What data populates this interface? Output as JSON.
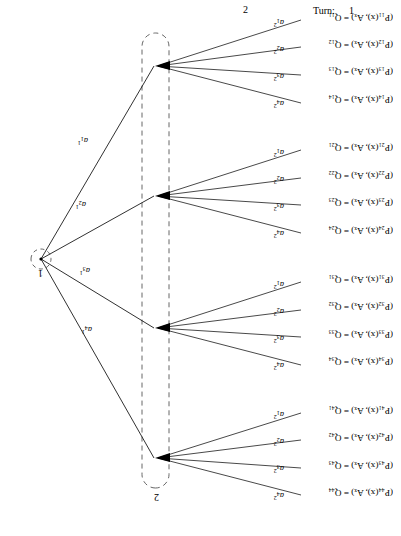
{
  "header": {
    "turn_label": "Turn:",
    "turn_value": "1",
    "player_marker": "2"
  },
  "tree": {
    "root": {
      "id": "root",
      "player_label": "1",
      "x": 360,
      "y": 277
    },
    "infoset": {
      "player_label": "2",
      "label_x": 245,
      "label_y": 41
    },
    "decision_nodes": [
      {
        "id": "n1",
        "x": 245,
        "y": 470,
        "group": 1
      },
      {
        "id": "n2",
        "x": 245,
        "y": 340,
        "group": 2
      },
      {
        "id": "n3",
        "x": 245,
        "y": 208,
        "group": 3
      },
      {
        "id": "n4",
        "x": 245,
        "y": 78,
        "group": 4
      }
    ],
    "root_edges": [
      {
        "label_base": "a",
        "sub": "1",
        "sup": "1",
        "to": "n1",
        "lx": 313,
        "ly": 392
      },
      {
        "label_base": "a",
        "sub": "2",
        "sup": "1",
        "to": "n2",
        "lx": 315,
        "ly": 328
      },
      {
        "label_base": "a",
        "sub": "3",
        "sup": "1",
        "to": "n3",
        "lx": 312,
        "ly": 262
      },
      {
        "label_base": "a",
        "sub": "4",
        "sup": "1",
        "to": "n4",
        "lx": 310,
        "ly": 203
      }
    ],
    "groups": [
      {
        "node": "n1",
        "leaves": [
          {
            "text": "(P₁₁(x), Aₓ) = Q₁₁",
            "p": "P",
            "psub": "11",
            "q": "Q",
            "qsub": "11",
            "lx": 8,
            "ly": 514,
            "tx": 96,
            "ty": 518
          },
          {
            "text": "(P₁₂(x), Aₓ) = Q₁₂",
            "p": "P",
            "psub": "12",
            "q": "Q",
            "qsub": "12",
            "lx": 8,
            "ly": 487,
            "tx": 96,
            "ty": 490
          },
          {
            "text": "(P₁₃(x), Aₓ) = Q₁₃",
            "p": "P",
            "psub": "13",
            "q": "Q",
            "qsub": "13",
            "lx": 8,
            "ly": 460,
            "tx": 96,
            "ty": 462
          },
          {
            "text": "(P₁₄(x), Aₓ) = Q₁₄",
            "p": "P",
            "psub": "14",
            "q": "Q",
            "qsub": "14",
            "lx": 8,
            "ly": 432,
            "tx": 96,
            "ty": 434
          }
        ],
        "edges": [
          {
            "sub": "1",
            "sup": "2",
            "lx": 117,
            "ly": 508
          },
          {
            "sub": "2",
            "sup": "2",
            "lx": 117,
            "ly": 481
          },
          {
            "sub": "3",
            "sup": "2",
            "lx": 117,
            "ly": 454
          },
          {
            "sub": "4",
            "sup": "2",
            "lx": 117,
            "ly": 427
          }
        ]
      },
      {
        "node": "n2",
        "leaves": [
          {
            "text": "(P₂₁(x), Aₓ) = Q₂₁",
            "p": "P",
            "psub": "21",
            "q": "Q",
            "qsub": "21",
            "lx": 8,
            "ly": 384,
            "tx": 96,
            "ty": 387
          },
          {
            "text": "(P₂₂(x), Aₓ) = Q₂₂",
            "p": "P",
            "psub": "22",
            "q": "Q",
            "qsub": "22",
            "lx": 8,
            "ly": 356,
            "tx": 96,
            "ty": 359
          },
          {
            "text": "(P₂₃(x), Aₓ) = Q₂₃",
            "p": "P",
            "psub": "23",
            "q": "Q",
            "qsub": "23",
            "lx": 8,
            "ly": 329,
            "tx": 96,
            "ty": 331
          },
          {
            "text": "(P₂₄(x), Aₓ) = Q₂₄",
            "p": "P",
            "psub": "24",
            "q": "Q",
            "qsub": "24",
            "lx": 8,
            "ly": 301,
            "tx": 96,
            "ty": 303
          }
        ],
        "edges": [
          {
            "sub": "1",
            "sup": "2",
            "lx": 117,
            "ly": 378
          },
          {
            "sub": "2",
            "sup": "2",
            "lx": 117,
            "ly": 351
          },
          {
            "sub": "3",
            "sup": "2",
            "lx": 117,
            "ly": 324
          },
          {
            "sub": "4",
            "sup": "2",
            "lx": 117,
            "ly": 297
          }
        ]
      },
      {
        "node": "n3",
        "leaves": [
          {
            "text": "(P₃₁(x), Aₓ) = Q₃₁",
            "p": "P",
            "psub": "31",
            "q": "Q",
            "qsub": "31",
            "lx": 8,
            "ly": 252,
            "tx": 96,
            "ty": 255
          },
          {
            "text": "(P₃₂(x), Aₓ) = Q₃₂",
            "p": "P",
            "psub": "32",
            "q": "Q",
            "qsub": "32",
            "lx": 8,
            "ly": 225,
            "tx": 96,
            "ty": 227
          },
          {
            "text": "(P₃₃(x), Aₓ) = Q₃₃",
            "p": "P",
            "psub": "33",
            "q": "Q",
            "qsub": "33",
            "lx": 8,
            "ly": 197,
            "tx": 96,
            "ty": 199
          },
          {
            "text": "(P₃₄(x), Aₓ) = Q₃₄",
            "p": "P",
            "psub": "34",
            "q": "Q",
            "qsub": "34",
            "lx": 8,
            "ly": 170,
            "tx": 96,
            "ty": 172
          }
        ],
        "edges": [
          {
            "sub": "1",
            "sup": "2",
            "lx": 117,
            "ly": 246
          },
          {
            "sub": "2",
            "sup": "2",
            "lx": 117,
            "ly": 219
          },
          {
            "sub": "3",
            "sup": "2",
            "lx": 117,
            "ly": 192
          },
          {
            "sub": "4",
            "sup": "2",
            "lx": 117,
            "ly": 165
          }
        ]
      },
      {
        "node": "n4",
        "leaves": [
          {
            "text": "(P₄₁(x), Aₓ) = Q₄₁",
            "p": "P",
            "psub": "41",
            "q": "Q",
            "qsub": "41",
            "lx": 8,
            "ly": 121,
            "tx": 96,
            "ty": 124
          },
          {
            "text": "(P₄₂(x), Aₓ) = Q₄₂",
            "p": "P",
            "psub": "42",
            "q": "Q",
            "qsub": "42",
            "lx": 8,
            "ly": 94,
            "tx": 96,
            "ty": 96
          },
          {
            "text": "(P₄₃(x), Aₓ) = Q₄₃",
            "p": "P",
            "psub": "43",
            "q": "Q",
            "qsub": "43",
            "lx": 8,
            "ly": 66,
            "tx": 96,
            "ty": 68
          },
          {
            "text": "(P₄₄(x), Aₓ) = Q₄₄",
            "p": "P",
            "psub": "44",
            "q": "Q",
            "qsub": "44",
            "lx": 8,
            "ly": 39,
            "tx": 96,
            "ty": 41
          }
        ],
        "edges": [
          {
            "sub": "1",
            "sup": "2",
            "lx": 117,
            "ly": 116
          },
          {
            "sub": "2",
            "sup": "2",
            "lx": 117,
            "ly": 89
          },
          {
            "sub": "3",
            "sup": "2",
            "lx": 117,
            "ly": 62
          },
          {
            "sub": "4",
            "sup": "2",
            "lx": 117,
            "ly": 35
          }
        ]
      }
    ]
  },
  "style": {
    "line_color": "#1a1a1a",
    "dash_color": "#555555",
    "background": "#ffffff"
  }
}
